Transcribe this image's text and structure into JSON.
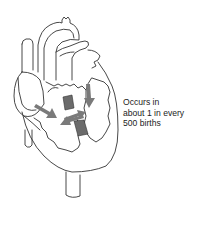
{
  "diagram": {
    "caption_lines": [
      "Occurs in",
      "about 1 in every",
      "500 births"
    ],
    "colors": {
      "outline": "#333333",
      "arrow": "#7a7a7a",
      "septum": "#6b6b6b",
      "background": "#ffffff"
    }
  }
}
